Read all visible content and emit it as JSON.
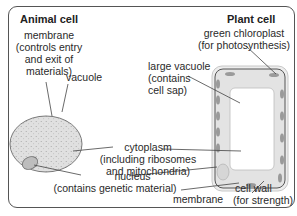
{
  "animal": {
    "title": "Animal cell",
    "membrane": [
      "membrane",
      "(controls entry",
      "and exit of",
      "materials)"
    ],
    "vacuole": "vacuole"
  },
  "plant": {
    "title": "Plant cell",
    "chloroplast": [
      "green chloroplast",
      "(for photosynthesis)"
    ],
    "large_vacuole": [
      "large vacuole",
      "(contains",
      "cell sap)"
    ],
    "membrane": "membrane",
    "cell_wall": [
      "cell wall",
      "(for strength)"
    ]
  },
  "shared": {
    "cytoplasm": [
      "cytoplasm",
      "(including ribosomes",
      "and mitochondria)"
    ],
    "nucleus": [
      "nucleus",
      "(contains genetic material)"
    ]
  },
  "colors": {
    "cytoplasm_fill": "#e2e2e2",
    "cell_wall_fill": "#ececec",
    "vacuole_fill": "#ffffff",
    "chloroplast": "#9a9a9a",
    "outline": "#6a6a6a",
    "leader": "#444444"
  }
}
